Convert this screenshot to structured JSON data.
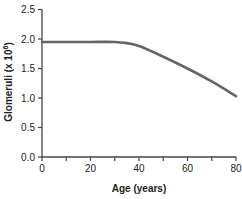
{
  "chart_data": {
    "type": "line",
    "title": "",
    "xlabel": "Age (years)",
    "ylabel": "Glomeruli (x 10^6)",
    "ylabel_parts": {
      "main": "Glomeruli (x 10",
      "sup": "6",
      "end": ")"
    },
    "xlim": [
      0,
      80
    ],
    "ylim": [
      0,
      2.5
    ],
    "x_ticks": [
      0,
      10,
      20,
      30,
      40,
      50,
      60,
      70,
      80
    ],
    "x_tick_labels": [
      "0",
      "20",
      "40",
      "60",
      "80"
    ],
    "x_tick_label_values": [
      0,
      20,
      40,
      60,
      80
    ],
    "y_ticks": [
      0.0,
      0.5,
      1.0,
      1.5,
      2.0,
      2.5
    ],
    "y_tick_labels": [
      "0.0",
      "0.5",
      "1.0",
      "1.5",
      "2.0",
      "2.5"
    ],
    "grid": false,
    "legend": null,
    "series": [
      {
        "name": "Glomeruli count",
        "color": "#666666",
        "x": [
          0,
          10,
          20,
          30,
          35,
          40,
          50,
          60,
          70,
          80
        ],
        "values": [
          1.95,
          1.95,
          1.95,
          1.95,
          1.93,
          1.88,
          1.7,
          1.5,
          1.28,
          1.03
        ]
      }
    ]
  }
}
